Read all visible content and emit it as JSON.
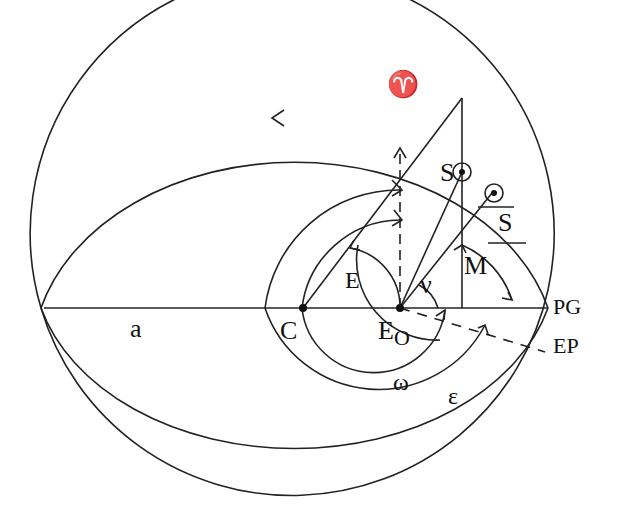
{
  "diagram": {
    "labels": {
      "aries": "♈",
      "sun": "S",
      "mean_sun": "S",
      "mean_anomaly": "M",
      "eccentric_anomaly": "E",
      "true_anomaly": "ν",
      "semi_major_axis": "a",
      "center": "C",
      "earth": "E",
      "earth_sub": "O",
      "perigee": "PG",
      "equinox_point": "EP",
      "arg_perigee": "ω",
      "epsilon": "ε"
    },
    "colors": {
      "stroke": "#222222",
      "background": "#ffffff"
    }
  }
}
